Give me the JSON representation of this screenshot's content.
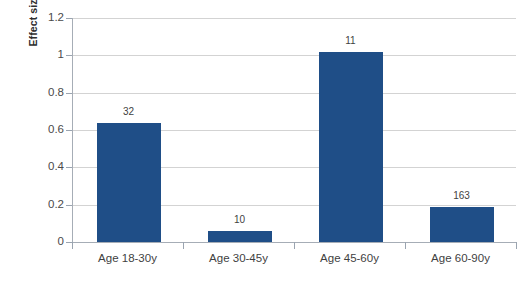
{
  "chart_data": {
    "type": "bar",
    "title": "",
    "subtitle": "",
    "xlabel": "",
    "ylabel": "Effect size",
    "categories": [
      "Age 18-30y",
      "Age 30-45y",
      "Age 45-60y",
      "Age 60-90y"
    ],
    "values": [
      0.64,
      0.06,
      1.02,
      0.19
    ],
    "point_labels": [
      "32",
      "10",
      "11",
      "163"
    ],
    "point_label_meaning": "sample size n above each bar",
    "ylim": [
      0,
      1.2
    ],
    "ytick_labels": [
      "0",
      "0.2",
      "0.4",
      "0.6",
      "0.8",
      "1",
      "1.2"
    ],
    "ytick_values": [
      0,
      0.2,
      0.4,
      0.6,
      0.8,
      1,
      1.2
    ],
    "grid": "horizontal",
    "legend": "none",
    "series": [
      {
        "name": "Effect size",
        "color": "#1F4E87",
        "values": [
          0.64,
          0.06,
          1.02,
          0.19
        ]
      }
    ],
    "colors": {
      "bar": "#1F4E87",
      "gridline": "#D3D3D3",
      "axis": "#A6ADB6",
      "text": "#3F3F3F",
      "background": "#FFFFFF"
    }
  }
}
